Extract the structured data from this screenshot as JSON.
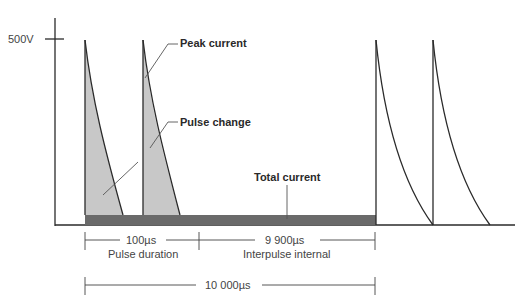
{
  "diagram": {
    "type": "pulse_waveform",
    "y_axis": {
      "tick_label": "500V"
    },
    "callouts": {
      "peak_current": "Peak current",
      "pulse_change": "Pulse change",
      "total_current": "Total current"
    },
    "dimensions": {
      "pulse_duration_value": "100µs",
      "pulse_duration_label": "Pulse duration",
      "interpulse_value": "9 900µs",
      "interpulse_label": "Interpulse internal",
      "total_period_value": "10 000µs"
    },
    "colors": {
      "line": "#2a2a2a",
      "pulse_fill": "#c8c8c8",
      "total_current_bar": "#6a6a6a"
    }
  }
}
